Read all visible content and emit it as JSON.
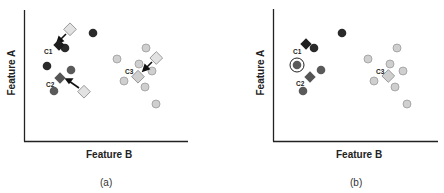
{
  "colors": {
    "axis": "#222222",
    "c1_point": "#2a2a2a",
    "c2_point": "#5a5a5a",
    "c3_point": "#cfcfcf",
    "c3_stroke": "#9a9a9a",
    "old_centroid": "#e2e2e2",
    "arrow": "#111111"
  },
  "panels": [
    {
      "id": "a",
      "caption": "(a)",
      "xlabel": "Feature B",
      "ylabel": "Feature A",
      "clusters": [
        {
          "label": "C1",
          "centroid": [
            55,
            46
          ],
          "old_centroid": [
            70,
            30
          ]
        },
        {
          "label": "C2",
          "centroid": [
            59,
            78
          ],
          "old_centroid": [
            84,
            91
          ]
        },
        {
          "label": "C3",
          "centroid": [
            138,
            76
          ],
          "old_centroid": [
            157,
            58
          ]
        }
      ]
    },
    {
      "id": "b",
      "caption": "(b)",
      "xlabel": "Feature B",
      "ylabel": "Feature A",
      "clusters": [
        {
          "label": "C1",
          "centroid": [
            84,
            44
          ]
        },
        {
          "label": "C2",
          "centroid": [
            88,
            77
          ]
        },
        {
          "label": "C3",
          "centroid": [
            167,
            76
          ]
        }
      ]
    }
  ]
}
